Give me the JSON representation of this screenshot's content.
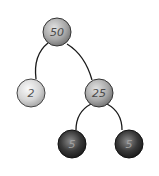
{
  "diagram": {
    "type": "binary-tree",
    "nodes": [
      {
        "id": "n50",
        "label": "50",
        "cx": 57,
        "cy": 32,
        "r": 14,
        "fill_light": "#d8d8d8",
        "fill_dark": "#7a7a7a",
        "text_color": "#4a4a4a"
      },
      {
        "id": "n2",
        "label": "2",
        "cx": 31,
        "cy": 93,
        "r": 14,
        "fill_light": "#f0f0f0",
        "fill_dark": "#b0b0b0",
        "text_color": "#555555"
      },
      {
        "id": "n25",
        "label": "25",
        "cx": 99,
        "cy": 93,
        "r": 14,
        "fill_light": "#d8d8d8",
        "fill_dark": "#7a7a7a",
        "text_color": "#4a4a4a"
      },
      {
        "id": "n5a",
        "label": "5",
        "cx": 72,
        "cy": 144,
        "r": 14,
        "fill_light": "#9a9a9a",
        "fill_dark": "#1e1e1e",
        "text_color": "#a0a0a0"
      },
      {
        "id": "n5b",
        "label": "5",
        "cx": 129,
        "cy": 144,
        "r": 14,
        "fill_light": "#9a9a9a",
        "fill_dark": "#1e1e1e",
        "text_color": "#a0a0a0"
      }
    ],
    "edges": [
      {
        "from": "50",
        "to": "2",
        "path": "M 48 43 Q 33 55 36 79"
      },
      {
        "from": "50",
        "to": "25",
        "path": "M 67 44 Q 85 55 92 80"
      },
      {
        "from": "25",
        "to": "5",
        "path": "M 91 104 Q 76 112 76 130"
      },
      {
        "from": "25",
        "to": "5",
        "path": "M 107 104 Q 122 112 122 130"
      }
    ],
    "edge_color": "#1a1a1a"
  }
}
